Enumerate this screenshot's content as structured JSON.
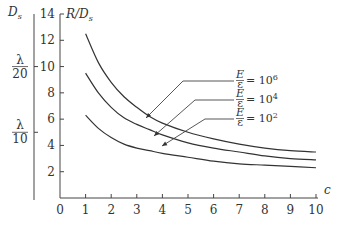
{
  "chart_data": {
    "type": "line",
    "title": "",
    "xlabel": "c",
    "ylabel": "R/D_s",
    "secondary_ylabel": "D_s",
    "xlim": [
      0,
      10
    ],
    "ylim": [
      0,
      14
    ],
    "x_ticks": [
      "0",
      "1",
      "2",
      "3",
      "4",
      "5",
      "6",
      "7",
      "8",
      "9",
      "10"
    ],
    "y_ticks": [
      "2",
      "4",
      "6",
      "8",
      "10",
      "12",
      "14"
    ],
    "secondary_y_ticks": [
      {
        "label_num": "λ",
        "label_den": "20",
        "at": 10
      },
      {
        "label_num": "λ",
        "label_den": "10",
        "at": 5
      }
    ],
    "grid": false,
    "legend_position": "inline-annotations-right",
    "x": [
      1,
      1.5,
      2,
      2.5,
      3,
      3.5,
      4,
      5,
      6,
      7,
      8,
      9,
      10
    ],
    "series": [
      {
        "name": "E/ε = 10^6",
        "label_frac": "E/ε",
        "label_value": "= 10",
        "label_exp": "6",
        "values": [
          12.5,
          10.3,
          8.8,
          7.7,
          6.9,
          6.2,
          5.7,
          5.0,
          4.5,
          4.1,
          3.8,
          3.6,
          3.5
        ]
      },
      {
        "name": "E/ε = 10^4",
        "label_frac": "E/ε",
        "label_value": "= 10",
        "label_exp": "4",
        "values": [
          9.5,
          8.0,
          6.9,
          6.1,
          5.6,
          5.2,
          4.8,
          4.2,
          3.8,
          3.5,
          3.2,
          3.0,
          2.9
        ]
      },
      {
        "name": "E/ε = 10^2",
        "label_frac": "E/ε",
        "label_value": "= 10",
        "label_exp": "2",
        "values": [
          6.3,
          5.3,
          4.6,
          4.1,
          3.8,
          3.6,
          3.4,
          3.1,
          2.8,
          2.6,
          2.5,
          2.4,
          2.3
        ]
      }
    ]
  }
}
